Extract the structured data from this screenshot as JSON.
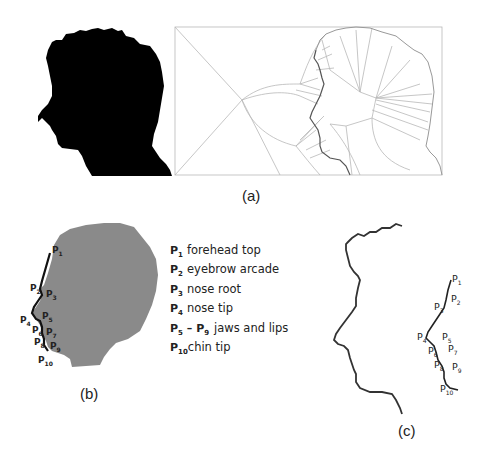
{
  "figure": {
    "panels": [
      {
        "id": "a",
        "caption": "(a)",
        "description": "Black head profile silhouette and its Voronoi/medial-axis skeleton diagram"
      },
      {
        "id": "b",
        "caption": "(b)",
        "description": "Gray silhouette with facial profile landmarks P1-P10"
      },
      {
        "id": "c",
        "caption": "(c)",
        "description": "Extracted profile contour and landmark segment"
      }
    ],
    "colors": {
      "silhouette_a": "#000000",
      "silhouette_b": "#8a8a8a",
      "voronoi_lines": "#b8b8b8",
      "profile_line": "#333333",
      "text": "#222222"
    }
  },
  "panel_a": {
    "caption": "(a)"
  },
  "panel_b": {
    "caption": "(b)",
    "landmark_labels": [
      "P",
      "P",
      "P",
      "P",
      "P",
      "P",
      "P",
      "P",
      "P",
      "P"
    ],
    "landmark_subs": [
      "1",
      "2",
      "3",
      "4",
      "5",
      "6",
      "7",
      "8",
      "9",
      "10"
    ],
    "legend": [
      {
        "key": "P",
        "sub": "1",
        "label": "forehead top"
      },
      {
        "key": "P",
        "sub": "2",
        "label": "eyebrow arcade"
      },
      {
        "key": "P",
        "sub": "3",
        "label": "nose root"
      },
      {
        "key": "P",
        "sub": "4",
        "label": "nose tip"
      },
      {
        "key": "P",
        "sub": "5",
        "key_end": "P",
        "sub_end": "9",
        "dash": "–",
        "label": "jaws and lips"
      },
      {
        "key": "P",
        "sub": "10",
        "label": "chin tip"
      }
    ]
  },
  "panel_c": {
    "caption": "(c)",
    "landmark_labels": [
      "P",
      "P",
      "P",
      "P",
      "P",
      "P",
      "P",
      "P",
      "P",
      "P"
    ],
    "landmark_subs": [
      "1",
      "2",
      "3",
      "4",
      "5",
      "6",
      "7",
      "8",
      "9",
      "10"
    ]
  }
}
